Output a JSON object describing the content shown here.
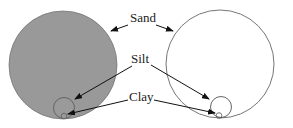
{
  "diagram": {
    "labels": {
      "sand": "Sand",
      "silt": "Silt",
      "clay": "Clay"
    },
    "colors": {
      "filled": "#999999",
      "stroke": "#555555",
      "arrow": "#111111",
      "background": "#ffffff"
    },
    "panels": [
      {
        "name": "filled-particles",
        "fill": "#999999"
      },
      {
        "name": "outline-particles",
        "fill": "none"
      }
    ]
  }
}
